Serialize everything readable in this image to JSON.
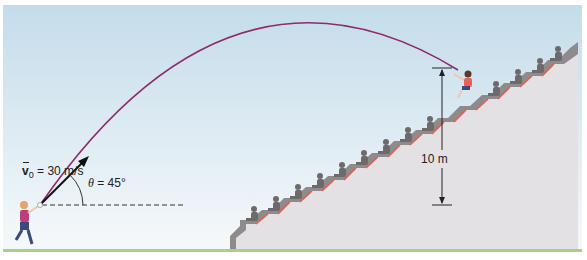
{
  "figure": {
    "type": "projectile-motion-diagram",
    "labels": {
      "velocity_symbol": "v",
      "velocity_subscript": "0",
      "velocity_value": " = 30 m/s",
      "angle_symbol": "θ",
      "angle_value": " = 45°",
      "height_label": "10 m"
    },
    "colors": {
      "sky_top": "#c4dcea",
      "sky_bottom": "#f4f8fb",
      "trajectory": "#8e2a6e",
      "arrow": "#111111",
      "stands": "#e2dfe3",
      "stand_shadow": "#8f8a8c",
      "seat_accent": "#e0614f",
      "ground": "#a9cf8a",
      "spectator": "#6e6a6b"
    },
    "values": {
      "initial_speed_m_s": 30,
      "launch_angle_deg": 45,
      "landing_height_m": 10
    }
  }
}
